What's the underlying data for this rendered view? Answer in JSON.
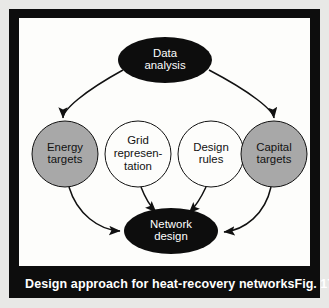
{
  "figure": {
    "caption": "Design approach for heat-recovery networks",
    "figure_number": "Fig. 17",
    "frame_color": "#0d0d0d",
    "panel_color": "#fdfdfb"
  },
  "palette": {
    "dark_node_fill": "#0d0d0d",
    "dark_node_text": "#ffffff",
    "shaded_node_fill": "#a8a8a8",
    "shaded_node_text": "#111111",
    "plain_node_fill": "#fdfdfb",
    "plain_node_text": "#111111",
    "stroke": "#111111"
  },
  "chart_data": {
    "type": "diagram",
    "title": "Design approach for heat-recovery networks",
    "nodes": [
      {
        "id": "data-analysis",
        "lines": [
          "Data",
          "analysis"
        ],
        "shape": "ellipse",
        "style": "dark",
        "cx": 146,
        "cy": 42,
        "rx": 47,
        "ry": 23
      },
      {
        "id": "energy-targets",
        "lines": [
          "Energy",
          "targets"
        ],
        "shape": "circle",
        "style": "shaded",
        "cx": 46,
        "cy": 136,
        "rx": 33,
        "ry": 33
      },
      {
        "id": "grid-representation",
        "lines": [
          "Grid",
          "represen-",
          "tation"
        ],
        "shape": "circle",
        "style": "plain",
        "cx": 119,
        "cy": 136,
        "rx": 33,
        "ry": 33
      },
      {
        "id": "design-rules",
        "lines": [
          "Design",
          "rules"
        ],
        "shape": "circle",
        "style": "plain",
        "cx": 192,
        "cy": 136,
        "rx": 33,
        "ry": 33
      },
      {
        "id": "capital-targets",
        "lines": [
          "Capital",
          "targets"
        ],
        "shape": "circle",
        "style": "shaded",
        "cx": 255,
        "cy": 136,
        "rx": 33,
        "ry": 33
      },
      {
        "id": "network-design",
        "lines": [
          "Network",
          "design"
        ],
        "shape": "ellipse",
        "style": "dark",
        "cx": 152,
        "cy": 213,
        "rx": 47,
        "ry": 23
      }
    ],
    "edges": [
      {
        "id": "data-analysis-to-energy-targets",
        "from": "data-analysis",
        "to": "energy-targets",
        "path": "M 104 52 C 64 74, 44 92, 44 100"
      },
      {
        "id": "data-analysis-to-capital-targets",
        "from": "data-analysis",
        "to": "capital-targets",
        "path": "M 190 52 C 232 74, 254 92, 255 100"
      },
      {
        "id": "energy-targets-to-network-design",
        "from": "energy-targets",
        "to": "network-design",
        "path": "M 50 169 C 58 196, 80 212, 101 213"
      },
      {
        "id": "grid-representation-to-network-design",
        "from": "grid-representation",
        "to": "network-design",
        "path": "M 122 169 C 127 182, 133 190, 137 194"
      },
      {
        "id": "design-rules-to-network-design",
        "from": "design-rules",
        "to": "network-design",
        "path": "M 187 169 C 181 182, 175 190, 170 195"
      },
      {
        "id": "capital-targets-to-network-design",
        "from": "capital-targets",
        "to": "network-design",
        "path": "M 252 169 C 246 196, 226 212, 205 214"
      }
    ]
  }
}
